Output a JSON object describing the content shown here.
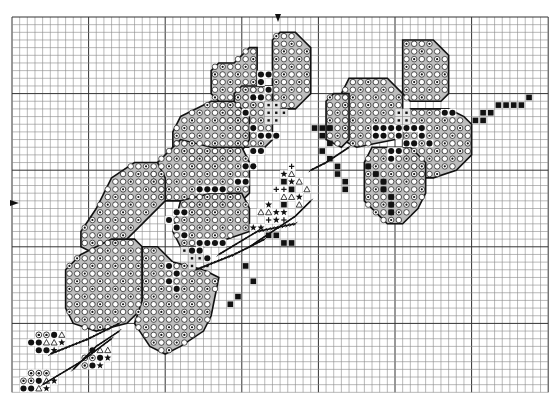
{
  "chart": {
    "grid": {
      "origin_x": 12,
      "origin_y": 17,
      "cell": 7.66,
      "cols": 70,
      "rows": 49,
      "major_every": 10
    },
    "colors": {
      "grid_line": "#8a8a8a",
      "grid_major": "#333333",
      "outline": "#111111",
      "fill_light": "#ffffff",
      "fill_shade": "#bdbdbd",
      "symbol": "#111111",
      "background": "#ffffff"
    },
    "center_markers": {
      "top": "center-column-arrow",
      "left": "center-row-arrow"
    },
    "symbols": {
      "ring": "open circle with dot (medium shade)",
      "circle": "open circle (light shade)",
      "dot": "filled black circle (dark)",
      "square": "filled black square (stem)",
      "star": "filled star",
      "triangle": "open triangle",
      "plus": "plus/cross",
      "light_square": "small open square (flower center)"
    },
    "petals": [
      {
        "name": "top-left-petal",
        "poly": [
          [
            29,
            6
          ],
          [
            31,
            4
          ],
          [
            32,
            4
          ],
          [
            32,
            13
          ],
          [
            31,
            14
          ],
          [
            28,
            14
          ],
          [
            27,
            13
          ],
          [
            27,
            11
          ],
          [
            26,
            10
          ],
          [
            26,
            7
          ],
          [
            27,
            6
          ]
        ]
      },
      {
        "name": "top-center-petal",
        "poly": [
          [
            35,
            2
          ],
          [
            37,
            2
          ],
          [
            38,
            3
          ],
          [
            39,
            4
          ],
          [
            39,
            10
          ],
          [
            38,
            11
          ],
          [
            37,
            12
          ],
          [
            35,
            12
          ],
          [
            34,
            11
          ],
          [
            34,
            3
          ]
        ]
      },
      {
        "name": "top-center-left-petal",
        "poly": [
          [
            30,
            9
          ],
          [
            34,
            9
          ],
          [
            34,
            16
          ],
          [
            33,
            17
          ],
          [
            30,
            17
          ],
          [
            29,
            16
          ],
          [
            29,
            10
          ]
        ]
      },
      {
        "name": "upper-left-leaf",
        "poly": [
          [
            22,
            13
          ],
          [
            26,
            11
          ],
          [
            29,
            11
          ],
          [
            31,
            13
          ],
          [
            31,
            16
          ],
          [
            29,
            19
          ],
          [
            26,
            20
          ],
          [
            24,
            20
          ],
          [
            23,
            19
          ],
          [
            22,
            17
          ],
          [
            21,
            17
          ],
          [
            21,
            15
          ]
        ]
      },
      {
        "name": "mid-left-leaf",
        "poly": [
          [
            19,
            19
          ],
          [
            22,
            16
          ],
          [
            26,
            17
          ],
          [
            30,
            17
          ],
          [
            31,
            19
          ],
          [
            31,
            23
          ],
          [
            29,
            25
          ],
          [
            26,
            26
          ],
          [
            23,
            26
          ],
          [
            22,
            24
          ],
          [
            20,
            24
          ],
          [
            18,
            23
          ],
          [
            18,
            21
          ]
        ]
      },
      {
        "name": "long-left-leaf",
        "poly": [
          [
            13,
            21
          ],
          [
            16,
            19
          ],
          [
            19,
            19
          ],
          [
            20,
            21
          ],
          [
            20,
            24
          ],
          [
            17,
            27
          ],
          [
            15,
            29
          ],
          [
            11,
            31
          ],
          [
            9,
            30
          ],
          [
            9,
            28
          ],
          [
            11,
            25
          ]
        ]
      },
      {
        "name": "lower-left-petal",
        "poly": [
          [
            9,
            31
          ],
          [
            13,
            29
          ],
          [
            16,
            29
          ],
          [
            17,
            30
          ],
          [
            17,
            38
          ],
          [
            15,
            40
          ],
          [
            11,
            41
          ],
          [
            8,
            40
          ],
          [
            7,
            38
          ],
          [
            7,
            33
          ]
        ]
      },
      {
        "name": "lower-center-petal",
        "poly": [
          [
            17,
            30
          ],
          [
            19,
            30
          ],
          [
            21,
            32
          ],
          [
            25,
            33
          ],
          [
            27,
            34
          ],
          [
            26,
            39
          ],
          [
            25,
            41
          ],
          [
            22,
            43
          ],
          [
            20,
            44
          ],
          [
            18,
            43
          ],
          [
            16,
            40
          ],
          [
            17,
            37
          ]
        ]
      },
      {
        "name": "center-upper-petal",
        "poly": [
          [
            22,
            24
          ],
          [
            26,
            23
          ],
          [
            30,
            23
          ],
          [
            31,
            25
          ],
          [
            31,
            28
          ],
          [
            28,
            29
          ],
          [
            25,
            30
          ],
          [
            22,
            30
          ],
          [
            21,
            28
          ]
        ]
      },
      {
        "name": "right-top-petal",
        "poly": [
          [
            51,
            3
          ],
          [
            55,
            3
          ],
          [
            56,
            4
          ],
          [
            57,
            5
          ],
          [
            57,
            10
          ],
          [
            56,
            11
          ],
          [
            52,
            11
          ],
          [
            51,
            10
          ]
        ]
      },
      {
        "name": "right-left-petal",
        "poly": [
          [
            44,
            8
          ],
          [
            49,
            8
          ],
          [
            51,
            10
          ],
          [
            51,
            15
          ],
          [
            50,
            16
          ],
          [
            45,
            17
          ],
          [
            43,
            16
          ],
          [
            43,
            10
          ]
        ]
      },
      {
        "name": "right-right-petal",
        "poly": [
          [
            52,
            12
          ],
          [
            57,
            12
          ],
          [
            59,
            13
          ],
          [
            60,
            14
          ],
          [
            60,
            18
          ],
          [
            58,
            20
          ],
          [
            55,
            21
          ],
          [
            52,
            21
          ],
          [
            51,
            20
          ],
          [
            51,
            14
          ]
        ]
      },
      {
        "name": "right-lower-petal",
        "poly": [
          [
            47,
            17
          ],
          [
            52,
            17
          ],
          [
            54,
            19
          ],
          [
            54,
            23
          ],
          [
            53,
            25
          ],
          [
            51,
            27
          ],
          [
            49,
            27
          ],
          [
            48,
            26
          ],
          [
            46,
            24
          ],
          [
            46,
            19
          ]
        ]
      },
      {
        "name": "right-far-leaf",
        "poly": [
          [
            42,
            10
          ],
          [
            44,
            10
          ],
          [
            44,
            16
          ],
          [
            43,
            17
          ],
          [
            41,
            16
          ],
          [
            41,
            11
          ]
        ]
      }
    ],
    "dark_cells": [
      [
        32,
        7
      ],
      [
        33,
        7
      ],
      [
        32,
        8
      ],
      [
        33,
        9
      ],
      [
        31,
        10
      ],
      [
        32,
        10
      ],
      [
        30,
        12
      ],
      [
        31,
        14
      ],
      [
        32,
        15
      ],
      [
        33,
        15
      ],
      [
        34,
        15
      ],
      [
        31,
        17
      ],
      [
        32,
        17
      ],
      [
        30,
        19
      ],
      [
        31,
        19
      ],
      [
        29,
        21
      ],
      [
        30,
        21
      ],
      [
        24,
        22
      ],
      [
        25,
        22
      ],
      [
        26,
        22
      ],
      [
        27,
        22
      ],
      [
        21,
        25
      ],
      [
        22,
        25
      ],
      [
        20,
        26
      ],
      [
        21,
        27
      ],
      [
        22,
        28
      ],
      [
        24,
        29
      ],
      [
        25,
        29
      ],
      [
        26,
        29
      ],
      [
        27,
        29
      ],
      [
        23,
        30
      ],
      [
        24,
        30
      ],
      [
        25,
        31
      ],
      [
        20,
        32
      ],
      [
        21,
        33
      ],
      [
        20,
        34
      ],
      [
        21,
        35
      ],
      [
        47,
        14
      ],
      [
        48,
        14
      ],
      [
        49,
        14
      ],
      [
        50,
        14
      ],
      [
        51,
        14
      ],
      [
        52,
        14
      ],
      [
        53,
        14
      ],
      [
        47,
        15
      ],
      [
        48,
        15
      ],
      [
        50,
        15
      ],
      [
        51,
        16
      ],
      [
        52,
        16
      ],
      [
        49,
        17
      ],
      [
        50,
        17
      ],
      [
        49,
        18
      ],
      [
        53,
        15
      ],
      [
        54,
        16
      ],
      [
        56,
        12
      ],
      [
        57,
        12
      ]
    ],
    "stem_squares": [
      [
        39,
        14
      ],
      [
        40,
        14
      ],
      [
        41,
        14
      ],
      [
        40,
        15
      ],
      [
        41,
        16
      ],
      [
        40,
        17
      ],
      [
        41,
        18
      ],
      [
        42,
        19
      ],
      [
        42,
        20
      ],
      [
        43,
        21
      ],
      [
        43,
        22
      ],
      [
        35,
        21
      ],
      [
        36,
        22
      ],
      [
        35,
        24
      ],
      [
        34,
        25
      ],
      [
        33,
        26
      ],
      [
        32,
        27
      ],
      [
        33,
        28
      ],
      [
        34,
        28
      ],
      [
        35,
        29
      ],
      [
        36,
        29
      ],
      [
        30,
        32
      ],
      [
        31,
        34
      ],
      [
        29,
        36
      ],
      [
        28,
        37
      ],
      [
        46,
        19
      ],
      [
        47,
        20
      ],
      [
        48,
        21
      ],
      [
        48,
        22
      ],
      [
        49,
        23
      ],
      [
        49,
        24
      ],
      [
        49,
        25
      ],
      [
        61,
        12
      ],
      [
        62,
        12
      ],
      [
        63,
        11
      ],
      [
        64,
        11
      ],
      [
        65,
        11
      ],
      [
        66,
        11
      ],
      [
        67,
        10
      ],
      [
        60,
        13
      ],
      [
        61,
        13
      ]
    ],
    "light_cells": [
      [
        33,
        11
      ],
      [
        34,
        11
      ],
      [
        33,
        12
      ],
      [
        34,
        12
      ],
      [
        35,
        12
      ],
      [
        33,
        13
      ],
      [
        34,
        13
      ],
      [
        50,
        12
      ],
      [
        51,
        12
      ],
      [
        50,
        13
      ],
      [
        51,
        13
      ],
      [
        22,
        30
      ],
      [
        23,
        31
      ],
      [
        24,
        31
      ],
      [
        25,
        32
      ],
      [
        23,
        32
      ]
    ],
    "star_cells": [
      [
        35,
        20
      ],
      [
        36,
        21
      ],
      [
        33,
        24
      ],
      [
        34,
        25
      ],
      [
        35,
        25
      ],
      [
        37,
        23
      ],
      [
        31,
        27
      ],
      [
        32,
        27
      ],
      [
        34,
        26
      ]
    ],
    "triangle_cells": [
      [
        36,
        20
      ],
      [
        37,
        21
      ],
      [
        38,
        22
      ],
      [
        35,
        23
      ],
      [
        36,
        23
      ],
      [
        37,
        24
      ],
      [
        32,
        25
      ],
      [
        33,
        25
      ]
    ],
    "plus_cells": [
      [
        36,
        19
      ],
      [
        34,
        22
      ],
      [
        35,
        22
      ],
      [
        33,
        26
      ],
      [
        35,
        26
      ]
    ],
    "backstitch": [
      [
        [
          31,
          30
        ],
        [
          37,
          26
        ],
        [
          39,
          24
        ]
      ],
      [
        [
          27,
          31
        ],
        [
          32,
          28
        ],
        [
          37,
          27
        ]
      ],
      [
        [
          39,
          20
        ],
        [
          41,
          19
        ],
        [
          44,
          17
        ]
      ],
      [
        [
          24,
          33
        ],
        [
          29,
          31
        ],
        [
          33,
          29
        ]
      ],
      [
        [
          5,
          44
        ],
        [
          10,
          42
        ],
        [
          14,
          40
        ]
      ],
      [
        [
          4,
          48
        ],
        [
          9,
          45
        ],
        [
          13,
          42
        ]
      ],
      [
        [
          8,
          46
        ],
        [
          11,
          43
        ],
        [
          14,
          41
        ]
      ]
    ],
    "clusters": [
      {
        "name": "cluster-1",
        "cells": [
          [
            3,
            42,
            "ring"
          ],
          [
            4,
            42,
            "ring"
          ],
          [
            5,
            42,
            "dot"
          ],
          [
            6,
            42,
            "triangle"
          ],
          [
            2,
            43,
            "dot"
          ],
          [
            3,
            43,
            "dot"
          ],
          [
            4,
            43,
            "triangle"
          ],
          [
            5,
            43,
            "triangle"
          ],
          [
            6,
            43,
            "star"
          ],
          [
            3,
            44,
            "dot"
          ],
          [
            4,
            44,
            "dot"
          ],
          [
            5,
            44,
            "star"
          ]
        ]
      },
      {
        "name": "cluster-2",
        "cells": [
          [
            10,
            44,
            "dot"
          ],
          [
            11,
            44,
            "triangle"
          ],
          [
            12,
            44,
            "triangle"
          ],
          [
            9,
            45,
            "ring"
          ],
          [
            10,
            45,
            "ring"
          ],
          [
            11,
            45,
            "dot"
          ],
          [
            12,
            45,
            "star"
          ],
          [
            9,
            46,
            "ring"
          ],
          [
            10,
            46,
            "dot"
          ],
          [
            11,
            46,
            "star"
          ]
        ]
      },
      {
        "name": "cluster-3",
        "cells": [
          [
            2,
            47,
            "ring"
          ],
          [
            3,
            47,
            "ring"
          ],
          [
            4,
            47,
            "ring"
          ],
          [
            1,
            48,
            "ring"
          ],
          [
            2,
            48,
            "ring"
          ],
          [
            3,
            48,
            "dot"
          ],
          [
            4,
            48,
            "triangle"
          ],
          [
            5,
            48,
            "star"
          ],
          [
            1,
            49,
            "dot"
          ],
          [
            2,
            49,
            "dot"
          ],
          [
            3,
            49,
            "triangle"
          ],
          [
            4,
            49,
            "star"
          ]
        ]
      }
    ]
  }
}
